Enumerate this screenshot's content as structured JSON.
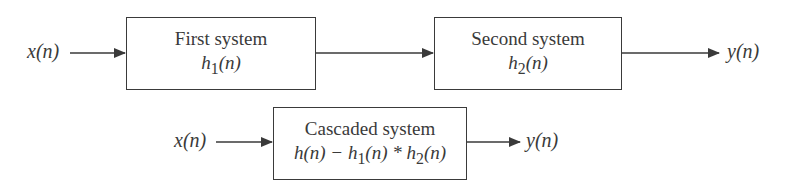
{
  "diagram": {
    "top_row": {
      "input": "x(n)",
      "blocks": [
        {
          "title": "First system",
          "response": "h",
          "sub": "1",
          "arg": "(n)"
        },
        {
          "title": "Second system",
          "response": "h",
          "sub": "2",
          "arg": "(n)"
        }
      ],
      "output": "y(n)"
    },
    "bottom_row": {
      "input": "x(n)",
      "block": {
        "title": "Cascaded system",
        "formula": "h(n) − h1(n) * h2(n)",
        "p1": "h(n) − h",
        "s1": "1",
        "p2": "(n) * h",
        "s2": "2",
        "p3": "(n)"
      },
      "output": "y(n)"
    },
    "colors": {
      "stroke": "#3a3a3a",
      "background": "#ffffff"
    }
  }
}
